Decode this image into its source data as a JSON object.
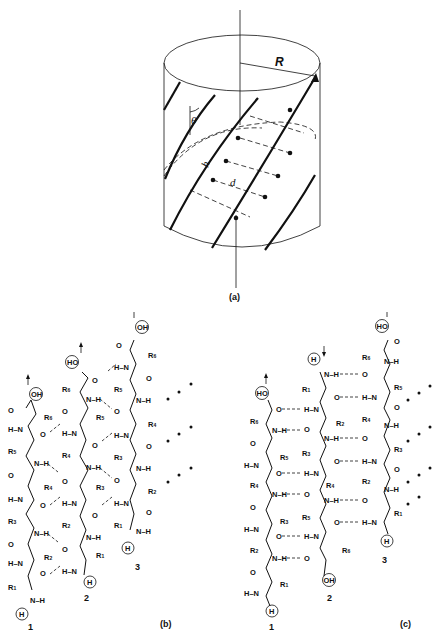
{
  "figure": {
    "panel_a": {
      "caption": "(a)",
      "labels": {
        "radius": "R",
        "angle": "θ",
        "rise": "h",
        "distance": "d"
      }
    },
    "panel_b": {
      "caption": "(b)",
      "strand_numbers": [
        "1",
        "2",
        "3"
      ],
      "terminal_groups": {
        "carboxyl": "OH",
        "amine": "H"
      },
      "strand_1_residues": [
        "R1",
        "R2",
        "R3",
        "R4",
        "R5",
        "R6"
      ],
      "strand_2_residues": [
        "R1",
        "R2",
        "R3",
        "R4",
        "R5",
        "R6"
      ],
      "strand_3_residues": [
        "R1",
        "R2",
        "R3",
        "R4",
        "R5",
        "R6"
      ],
      "continuation": "• • •"
    },
    "panel_c": {
      "caption": "(c)",
      "strand_numbers": [
        "1",
        "2",
        "3"
      ],
      "terminal_groups": {
        "carboxyl": "OH",
        "carboxyl_alt": "HO",
        "amine": "H"
      },
      "strand_1_residues": [
        "R1",
        "R2",
        "R3",
        "R4",
        "R5",
        "R6"
      ],
      "strand_2_residues": [
        "R1",
        "R2",
        "R3",
        "R4",
        "R5",
        "R6"
      ],
      "strand_3_residues": [
        "R1",
        "R2",
        "R3",
        "R4",
        "R5",
        "R6"
      ],
      "continuation": "• • •"
    }
  },
  "atoms": {
    "N": "N",
    "H": "H",
    "O": "O",
    "NH": "N–H",
    "HN": "H–N"
  }
}
